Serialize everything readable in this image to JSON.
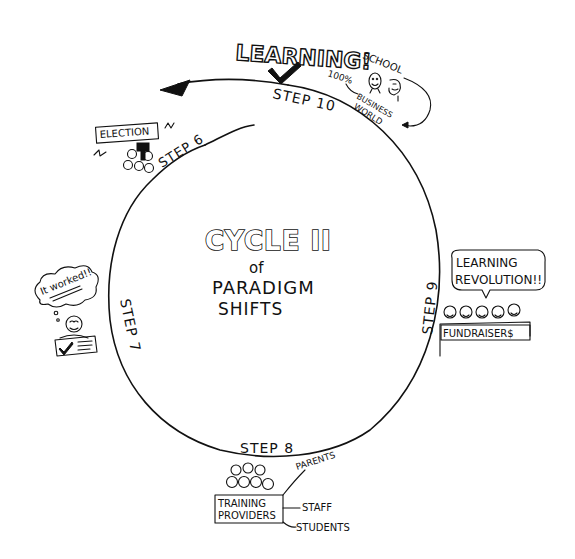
{
  "title": {
    "line1": "CYCLE II",
    "line2": "of",
    "line3": "PARADIGM",
    "line4": "SHIFTS"
  },
  "steps": [
    {
      "id": "step-6",
      "label": "STEP 6"
    },
    {
      "id": "step-7",
      "label": "STEP 7"
    },
    {
      "id": "step-8",
      "label": "STEP 8"
    },
    {
      "id": "step-9",
      "label": "STEP 9"
    },
    {
      "id": "step-10",
      "label": "STEP 10"
    }
  ],
  "step10_annotations": {
    "headline": "LEARNING!",
    "percent": "100%",
    "school": "SCHOOL",
    "business_world_line1": "BUSINESS",
    "business_world_line2": "WORLD"
  },
  "step6_annotations": {
    "sign": "ELECTION"
  },
  "step7_annotations": {
    "thought": "It worked!!"
  },
  "step8_annotations": {
    "box_line1": "TRAINING",
    "box_line2": "PROVIDERS",
    "labels": [
      "PARENTS",
      "STAFF",
      "STUDENTS"
    ]
  },
  "step9_annotations": {
    "speech_line1": "LEARNING",
    "speech_line2": "REVOLUTION!!",
    "sign": "FUNDRAISER$"
  },
  "colors": {
    "ink": "#111111",
    "paper": "#ffffff"
  }
}
